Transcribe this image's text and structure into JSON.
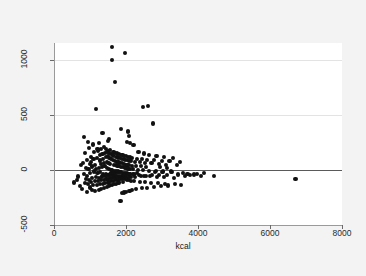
{
  "chart_data": {
    "type": "scatter",
    "title": "",
    "xlabel": "kcal",
    "ylabel": "Pearson residual",
    "xlim": [
      0,
      8000
    ],
    "ylim": [
      -500,
      1150
    ],
    "xticks": [
      0,
      2000,
      4000,
      6000,
      8000
    ],
    "yticks": [
      -500,
      0,
      500,
      1000
    ],
    "xtick_labels": [
      "0",
      "2000",
      "4000",
      "6000",
      "8000"
    ],
    "ytick_labels": [
      "-500",
      "0",
      "500",
      "1000"
    ],
    "grid": true,
    "gridlines_y": [
      1000,
      500,
      -500
    ],
    "reference_line": {
      "orientation": "horizontal",
      "y": 0,
      "color": "#5a5a5a"
    },
    "legend": null,
    "marker": {
      "shape": "circle",
      "color": "#111111",
      "size": 4
    },
    "n_points": 301,
    "points": [
      [
        520,
        -115
      ],
      [
        600,
        -95
      ],
      [
        640,
        -60
      ],
      [
        700,
        -150
      ],
      [
        720,
        40
      ],
      [
        760,
        -170
      ],
      [
        780,
        60
      ],
      [
        800,
        300
      ],
      [
        815,
        -40
      ],
      [
        830,
        -120
      ],
      [
        845,
        150
      ],
      [
        860,
        -80
      ],
      [
        870,
        20
      ],
      [
        880,
        -200
      ],
      [
        890,
        90
      ],
      [
        900,
        -55
      ],
      [
        910,
        250
      ],
      [
        920,
        -130
      ],
      [
        930,
        10
      ],
      [
        940,
        -90
      ],
      [
        950,
        200
      ],
      [
        960,
        -160
      ],
      [
        970,
        55
      ],
      [
        980,
        -25
      ],
      [
        990,
        120
      ],
      [
        1000,
        -110
      ],
      [
        1010,
        70
      ],
      [
        1020,
        -185
      ],
      [
        1030,
        30
      ],
      [
        1040,
        -70
      ],
      [
        1050,
        230
      ],
      [
        1060,
        -140
      ],
      [
        1070,
        95
      ],
      [
        1080,
        -15
      ],
      [
        1090,
        160
      ],
      [
        1100,
        -105
      ],
      [
        1110,
        45
      ],
      [
        1120,
        -195
      ],
      [
        1130,
        5
      ],
      [
        1140,
        -65
      ],
      [
        1150,
        555
      ],
      [
        1160,
        -135
      ],
      [
        1170,
        110
      ],
      [
        1180,
        -30
      ],
      [
        1190,
        175
      ],
      [
        1200,
        -100
      ],
      [
        1210,
        240
      ],
      [
        1215,
        -180
      ],
      [
        1220,
        15
      ],
      [
        1230,
        -75
      ],
      [
        1240,
        135
      ],
      [
        1250,
        -125
      ],
      [
        1255,
        85
      ],
      [
        1260,
        -20
      ],
      [
        1270,
        190
      ],
      [
        1280,
        -95
      ],
      [
        1285,
        50
      ],
      [
        1290,
        -175
      ],
      [
        1300,
        25
      ],
      [
        1310,
        -60
      ],
      [
        1320,
        145
      ],
      [
        1330,
        -130
      ],
      [
        1335,
        100
      ],
      [
        1340,
        -35
      ],
      [
        1350,
        210
      ],
      [
        1355,
        -90
      ],
      [
        1360,
        60
      ],
      [
        1370,
        -165
      ],
      [
        1375,
        35
      ],
      [
        1380,
        -55
      ],
      [
        1390,
        155
      ],
      [
        1400,
        -120
      ],
      [
        1405,
        115
      ],
      [
        1410,
        -40
      ],
      [
        1420,
        185
      ],
      [
        1430,
        -85
      ],
      [
        1435,
        75
      ],
      [
        1440,
        -155
      ],
      [
        1445,
        20
      ],
      [
        1450,
        -50
      ],
      [
        1455,
        165
      ],
      [
        1460,
        -115
      ],
      [
        1465,
        125
      ],
      [
        1470,
        -45
      ],
      [
        1475,
        170
      ],
      [
        1480,
        -80
      ],
      [
        1485,
        65
      ],
      [
        1490,
        -145
      ],
      [
        1495,
        10
      ],
      [
        1500,
        -45
      ],
      [
        1505,
        150
      ],
      [
        1510,
        -110
      ],
      [
        1515,
        105
      ],
      [
        1520,
        -38
      ],
      [
        1525,
        180
      ],
      [
        1530,
        -75
      ],
      [
        1535,
        55
      ],
      [
        1540,
        -140
      ],
      [
        1545,
        0
      ],
      [
        1550,
        -42
      ],
      [
        1555,
        140
      ],
      [
        1560,
        -105
      ],
      [
        1565,
        95
      ],
      [
        1570,
        -32
      ],
      [
        1575,
        1110
      ],
      [
        1580,
        -70
      ],
      [
        1585,
        995
      ],
      [
        1590,
        -135
      ],
      [
        1595,
        -5
      ],
      [
        1600,
        -48
      ],
      [
        1605,
        130
      ],
      [
        1610,
        -100
      ],
      [
        1615,
        88
      ],
      [
        1620,
        -28
      ],
      [
        1625,
        160
      ],
      [
        1630,
        -68
      ],
      [
        1635,
        48
      ],
      [
        1640,
        -130
      ],
      [
        1645,
        -10
      ],
      [
        1650,
        -52
      ],
      [
        1655,
        800
      ],
      [
        1660,
        -95
      ],
      [
        1665,
        80
      ],
      [
        1670,
        -25
      ],
      [
        1675,
        155
      ],
      [
        1680,
        -62
      ],
      [
        1685,
        42
      ],
      [
        1690,
        -125
      ],
      [
        1695,
        -12
      ],
      [
        1700,
        -58
      ],
      [
        1705,
        118
      ],
      [
        1710,
        -92
      ],
      [
        1715,
        72
      ],
      [
        1720,
        -22
      ],
      [
        1725,
        148
      ],
      [
        1730,
        -58
      ],
      [
        1735,
        38
      ],
      [
        1740,
        -120
      ],
      [
        1745,
        -15
      ],
      [
        1750,
        -62
      ],
      [
        1755,
        112
      ],
      [
        1760,
        -88
      ],
      [
        1765,
        68
      ],
      [
        1770,
        -18
      ],
      [
        1775,
        142
      ],
      [
        1780,
        -55
      ],
      [
        1785,
        32
      ],
      [
        1790,
        -115
      ],
      [
        1795,
        -18
      ],
      [
        1800,
        -68
      ],
      [
        1805,
        108
      ],
      [
        1810,
        -85
      ],
      [
        1815,
        62
      ],
      [
        1820,
        -280
      ],
      [
        1825,
        138
      ],
      [
        1830,
        -52
      ],
      [
        1835,
        28
      ],
      [
        1840,
        370
      ],
      [
        1845,
        -20
      ],
      [
        1850,
        -72
      ],
      [
        1855,
        102
      ],
      [
        1860,
        -82
      ],
      [
        1865,
        58
      ],
      [
        1870,
        -212
      ],
      [
        1875,
        132
      ],
      [
        1880,
        -48
      ],
      [
        1885,
        22
      ],
      [
        1890,
        -108
      ],
      [
        1895,
        -25
      ],
      [
        1900,
        -78
      ],
      [
        1905,
        98
      ],
      [
        1910,
        -78
      ],
      [
        1915,
        52
      ],
      [
        1920,
        -205
      ],
      [
        1925,
        128
      ],
      [
        1930,
        -45
      ],
      [
        1935,
        18
      ],
      [
        1940,
        1060
      ],
      [
        1945,
        -28
      ],
      [
        1950,
        -82
      ],
      [
        1955,
        92
      ],
      [
        1960,
        -72
      ],
      [
        1965,
        48
      ],
      [
        1970,
        -198
      ],
      [
        1975,
        122
      ],
      [
        1980,
        -42
      ],
      [
        1985,
        15
      ],
      [
        1990,
        250
      ],
      [
        1995,
        -32
      ],
      [
        2000,
        -88
      ],
      [
        2005,
        88
      ],
      [
        2010,
        -70
      ],
      [
        2015,
        45
      ],
      [
        2020,
        340
      ],
      [
        2025,
        118
      ],
      [
        2030,
        -40
      ],
      [
        2035,
        12
      ],
      [
        2040,
        355
      ],
      [
        2045,
        -35
      ],
      [
        2050,
        -92
      ],
      [
        2055,
        82
      ],
      [
        2060,
        -68
      ],
      [
        2065,
        42
      ],
      [
        2070,
        -190
      ],
      [
        2075,
        112
      ],
      [
        2080,
        -38
      ],
      [
        2085,
        8
      ],
      [
        2090,
        240
      ],
      [
        2095,
        -38
      ],
      [
        2100,
        -98
      ],
      [
        2110,
        78
      ],
      [
        2120,
        -65
      ],
      [
        2130,
        38
      ],
      [
        2140,
        -182
      ],
      [
        2150,
        108
      ],
      [
        2160,
        -35
      ],
      [
        2170,
        5
      ],
      [
        2180,
        225
      ],
      [
        2190,
        -42
      ],
      [
        2200,
        -102
      ],
      [
        2215,
        72
      ],
      [
        2230,
        -62
      ],
      [
        2245,
        35
      ],
      [
        2260,
        -175
      ],
      [
        2275,
        102
      ],
      [
        2290,
        -32
      ],
      [
        2305,
        2
      ],
      [
        2320,
        160
      ],
      [
        2335,
        -48
      ],
      [
        2350,
        -108
      ],
      [
        2365,
        68
      ],
      [
        2380,
        -58
      ],
      [
        2395,
        32
      ],
      [
        2410,
        -168
      ],
      [
        2425,
        98
      ],
      [
        2440,
        570
      ],
      [
        2450,
        -5
      ],
      [
        2460,
        148
      ],
      [
        2475,
        -52
      ],
      [
        2490,
        -112
      ],
      [
        2505,
        62
      ],
      [
        2520,
        -55
      ],
      [
        2535,
        28
      ],
      [
        2550,
        -162
      ],
      [
        2565,
        92
      ],
      [
        2580,
        580
      ],
      [
        2600,
        -8
      ],
      [
        2620,
        138
      ],
      [
        2640,
        -58
      ],
      [
        2660,
        -118
      ],
      [
        2680,
        58
      ],
      [
        2700,
        -50
      ],
      [
        2720,
        420
      ],
      [
        2740,
        -155
      ],
      [
        2760,
        88
      ],
      [
        2780,
        -22
      ],
      [
        2800,
        -12
      ],
      [
        2820,
        128
      ],
      [
        2840,
        -62
      ],
      [
        2860,
        -122
      ],
      [
        2880,
        52
      ],
      [
        2900,
        -48
      ],
      [
        2920,
        22
      ],
      [
        2940,
        -148
      ],
      [
        2960,
        82
      ],
      [
        2980,
        -18
      ],
      [
        3000,
        -15
      ],
      [
        3020,
        118
      ],
      [
        3040,
        -68
      ],
      [
        3060,
        -128
      ],
      [
        3080,
        48
      ],
      [
        3100,
        -45
      ],
      [
        3120,
        18
      ],
      [
        3150,
        -142
      ],
      [
        3180,
        78
      ],
      [
        3210,
        -15
      ],
      [
        3240,
        -18
      ],
      [
        3270,
        108
      ],
      [
        3300,
        -72
      ],
      [
        3340,
        -132
      ],
      [
        3380,
        45
      ],
      [
        3420,
        -42
      ],
      [
        3460,
        75
      ],
      [
        3500,
        -138
      ],
      [
        3560,
        -28
      ],
      [
        3620,
        -55
      ],
      [
        3680,
        -35
      ],
      [
        3760,
        -48
      ],
      [
        3850,
        -42
      ],
      [
        3950,
        -38
      ],
      [
        4050,
        -52
      ],
      [
        4150,
        -30
      ],
      [
        4420,
        -58
      ],
      [
        6680,
        -85
      ],
      [
        1180,
        190
      ],
      [
        1470,
        260
      ],
      [
        1510,
        280
      ],
      [
        2050,
        305
      ],
      [
        1320,
        330
      ]
    ]
  },
  "axes": {
    "x_title": "kcal",
    "y_title": "Pearson residual"
  }
}
